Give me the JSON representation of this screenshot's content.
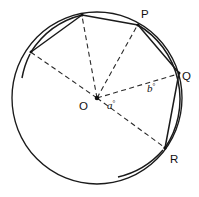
{
  "figure": {
    "background_color": "#ffffff",
    "stroke_color": "#1a1a1a",
    "circle": {
      "cx": 97,
      "cy": 98,
      "r": 85
    },
    "center": {
      "label": "O",
      "x": 97,
      "y": 98,
      "label_x": 79,
      "label_y": 106
    },
    "points": [
      {
        "name": "P",
        "label": "P",
        "x": 138,
        "y": 25,
        "label_x": 141,
        "label_y": 17,
        "labelled": true
      },
      {
        "name": "Q",
        "label": "Q",
        "x": 179,
        "y": 73,
        "label_x": 182,
        "label_y": 79,
        "labelled": true
      },
      {
        "name": "R",
        "label": "R",
        "x": 165,
        "y": 148,
        "label_x": 170,
        "label_y": 160,
        "labelled": true
      },
      {
        "name": "T",
        "label": "",
        "x": 82,
        "y": 15,
        "label_x": 0,
        "label_y": 0,
        "labelled": false
      },
      {
        "name": "S",
        "label": "",
        "x": 31,
        "y": 52,
        "label_x": 0,
        "label_y": 0,
        "labelled": false
      }
    ],
    "chords": [
      {
        "name": "chord-S-T",
        "from": "S",
        "to": "T"
      },
      {
        "name": "chord-T-P",
        "from": "T",
        "to": "P"
      },
      {
        "name": "chord-P-Q",
        "from": "P",
        "to": "Q"
      },
      {
        "name": "chord-Q-R",
        "from": "Q",
        "to": "R"
      }
    ],
    "radii": [
      {
        "name": "radius-O-T",
        "to": "T",
        "style": "dashed"
      },
      {
        "name": "radius-O-P",
        "to": "P",
        "style": "dashed"
      },
      {
        "name": "radius-O-Q",
        "to": "Q",
        "style": "dashed"
      },
      {
        "name": "radius-O-R",
        "to": "R",
        "style": "dashed"
      },
      {
        "name": "radius-O-S",
        "to": "S",
        "style": "dashed"
      }
    ],
    "arc_marks": [
      {
        "name": "arc-mark-upper-left",
        "description": "bold arc from S to T along circumference"
      },
      {
        "name": "arc-mark-left-tick",
        "description": "short tick below S"
      },
      {
        "name": "arc-mark-right",
        "description": "bold arc from P through Q to R"
      },
      {
        "name": "arc-mark-bottom-tick",
        "description": "short tick below R"
      }
    ],
    "angles": [
      {
        "name": "angle-a",
        "label": "a",
        "degree_symbol": "°",
        "x": 108,
        "y": 107,
        "between": [
          "Q",
          "R"
        ]
      },
      {
        "name": "angle-b",
        "label": "b",
        "degree_symbol": "°",
        "x": 148,
        "y": 90,
        "between": [
          "P",
          "Q"
        ]
      }
    ]
  }
}
